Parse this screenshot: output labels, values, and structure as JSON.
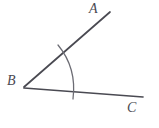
{
  "figure": {
    "kind": "geometry-diagram",
    "background_color": "#ffffff",
    "stroke_color": "#4a4a52",
    "stroke_width": 1.6,
    "canvas": {
      "width": 159,
      "height": 128
    },
    "labels": [
      {
        "id": "A",
        "text": "A",
        "x": 95,
        "y": 9,
        "style": "italic-serif"
      },
      {
        "id": "B",
        "text": "B",
        "x": 12,
        "y": 81,
        "style": "italic-serif"
      },
      {
        "id": "C",
        "text": "C",
        "x": 132,
        "y": 108,
        "style": "italic-serif"
      }
    ],
    "points": {
      "A": {
        "x": 110,
        "y": 12
      },
      "B": {
        "x": 24,
        "y": 87
      },
      "C": {
        "x": 143,
        "y": 97
      }
    },
    "segments": [
      {
        "id": "ray-BA",
        "from": "B",
        "to": "A",
        "x1": 24,
        "y1": 87,
        "x2": 110,
        "y2": 12
      },
      {
        "id": "ray-BC",
        "from": "B",
        "to": "C",
        "x1": 24,
        "y1": 88,
        "x2": 143,
        "y2": 97
      }
    ],
    "arc": {
      "id": "angle-arc",
      "center": {
        "x": 24,
        "y": 87
      },
      "radius": 48,
      "start": {
        "x": 58,
        "y": 45
      },
      "control": {
        "x": 76,
        "y": 66
      },
      "end": {
        "x": 73,
        "y": 99
      },
      "overshoot": true
    },
    "angle_name": "ABC"
  }
}
